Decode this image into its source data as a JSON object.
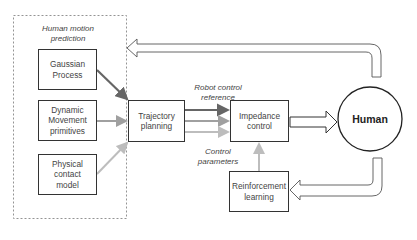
{
  "diagram": {
    "group": {
      "label_line1": "Human motion",
      "label_line2": "prediction",
      "items": [
        {
          "line1": "Gaussian",
          "line2": "Process",
          "line3": ""
        },
        {
          "line1": "Dynamic",
          "line2": "Movement",
          "line3": "primitives"
        },
        {
          "line1": "Physical",
          "line2": "contact",
          "line3": "model"
        }
      ]
    },
    "trajectory": {
      "line1": "Trajectory",
      "line2": "planning"
    },
    "impedance": {
      "line1": "Impedance",
      "line2": "control"
    },
    "reinforcement": {
      "line1": "Reinforcement",
      "line2": "learning"
    },
    "human": {
      "label": "Human"
    },
    "edge_labels": {
      "robot_ref_line1": "Robot control",
      "robot_ref_line2": "reference",
      "control_params_line1": "Control",
      "control_params_line2": "parameters"
    },
    "colors": {
      "stroke": "#333333",
      "arrow_dark": "#666666",
      "arrow_mid": "#999999",
      "arrow_light": "#bbbbbb",
      "dashed": "#888888"
    }
  }
}
